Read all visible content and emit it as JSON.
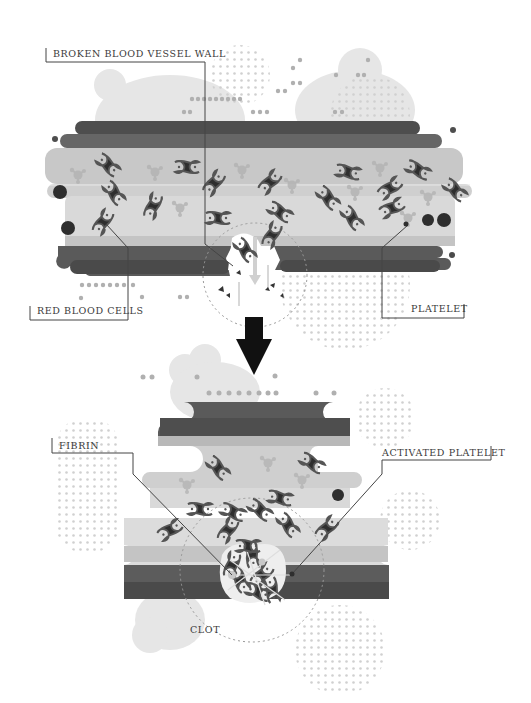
{
  "diagram": {
    "colors": {
      "background": "#ffffff",
      "vessel_wall_dark": "#5e5e5e",
      "vessel_wall_mid": "#6e6e6e",
      "vessel_lumen_light": "#c9c9c9",
      "vessel_lumen_lighter": "#d8d8d8",
      "red_blood_cell": "#2e2e2e",
      "red_blood_cell_outline": "#4a4a4a",
      "platelet": "#a8a8a8",
      "tissue_blob": "#e4e4e4",
      "dots": "#b5b5b5",
      "leader_line": "#444444",
      "arrow": "#111111"
    },
    "top_panel": {
      "name": "broken-vessel",
      "labels": {
        "broken_wall": "BROKEN BLOOD VESSEL WALL",
        "red_blood_cells": "RED BLOOD CELLS",
        "platelet": "PLATELET"
      }
    },
    "transition_arrow": {
      "icon": "down-arrow-icon"
    },
    "bottom_panel": {
      "name": "clot-formed",
      "labels": {
        "fibrin": "FIBRIN",
        "activated_platelet": "ACTIVATED PLATELET",
        "clot": "CLOT"
      }
    }
  }
}
